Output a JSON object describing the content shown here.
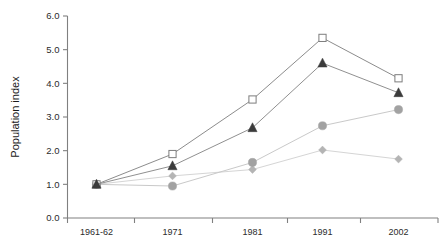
{
  "chart_data": {
    "type": "line",
    "title": "",
    "subtitle": "",
    "xlabel": "",
    "ylabel": "Population index",
    "categories": [
      "1961-62",
      "1971",
      "1981",
      "1991",
      "2002"
    ],
    "ylim": [
      0.0,
      6.0
    ],
    "ytick_labels": [
      "0.0",
      "1.0",
      "2.0",
      "3.0",
      "4.0",
      "5.0",
      "6.0"
    ],
    "ytick_values": [
      0.0,
      1.0,
      2.0,
      3.0,
      4.0,
      5.0,
      6.0
    ],
    "grid": false,
    "legend": "none",
    "series": [
      {
        "name": "open-square-series",
        "marker": "open-square",
        "color": "#8c8c8c",
        "marker_fill": "#ffffff",
        "values": [
          1.0,
          1.9,
          3.52,
          5.35,
          4.15
        ]
      },
      {
        "name": "filled-triangle-series",
        "marker": "filled-triangle",
        "color": "#909090",
        "marker_fill": "#3b3b3b",
        "values": [
          1.0,
          1.55,
          2.68,
          4.6,
          3.72
        ]
      },
      {
        "name": "filled-circle-series",
        "marker": "filled-circle",
        "color": "#c9c9c9",
        "marker_fill": "#a2a2a2",
        "values": [
          1.0,
          0.95,
          1.65,
          2.74,
          3.22
        ]
      },
      {
        "name": "filled-diamond-series",
        "marker": "filled-diamond",
        "color": "#d5d5d5",
        "marker_fill": "#b4b4b4",
        "values": [
          1.0,
          1.25,
          1.44,
          2.02,
          1.75
        ]
      }
    ]
  },
  "axes": {
    "y_axis_label": "Population index",
    "y_ticks": [
      "6.0",
      "5.0",
      "4.0",
      "3.0",
      "2.0",
      "1.0",
      "0.0"
    ],
    "x_ticks": [
      "1961-62",
      "1971",
      "1981",
      "1991",
      "2002"
    ],
    "axis_color": "#808080"
  }
}
